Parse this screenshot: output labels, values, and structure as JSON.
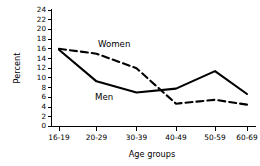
{
  "chart_data": {
    "type": "line",
    "title": "",
    "xlabel": "Age groups",
    "ylabel": "Percent",
    "categories": [
      "16-19",
      "20-29",
      "30-39",
      "40-49",
      "50-59",
      "60-69"
    ],
    "ylim": [
      0,
      24
    ],
    "yticks": [
      0,
      2,
      4,
      6,
      8,
      10,
      12,
      14,
      16,
      18,
      20,
      22,
      24
    ],
    "ytick_labels": [
      "0",
      "2",
      "4",
      "6",
      "8",
      "10",
      "12",
      "14",
      "16",
      "18",
      "20",
      "22",
      "24"
    ],
    "grid": false,
    "legend_position": "inline-annotations",
    "line_color": "#000000",
    "background_color": "#ffffff",
    "series": [
      {
        "name": "Women",
        "style": "dashed",
        "values": [
          16.0,
          15.0,
          12.0,
          4.7,
          5.5,
          4.5
        ]
      },
      {
        "name": "Men",
        "style": "solid",
        "values": [
          15.8,
          9.3,
          7.0,
          7.8,
          11.4,
          6.7
        ]
      }
    ],
    "annotations": [
      {
        "text": "Women",
        "series": "Women",
        "x_px": 98,
        "y_px": 44
      },
      {
        "text": "Men",
        "series": "Men",
        "x_px": 95,
        "y_px": 97
      }
    ]
  }
}
